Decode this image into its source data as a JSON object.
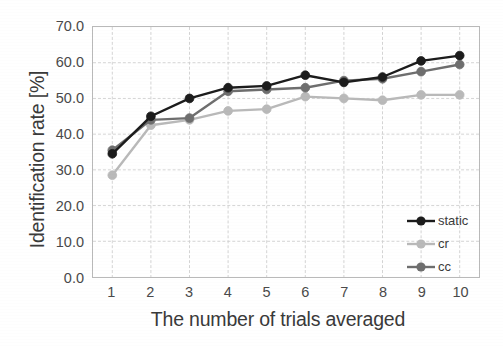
{
  "chart_data": {
    "type": "line",
    "title": "",
    "xlabel": "The number of trials averaged",
    "ylabel": "Identification rate [%]",
    "x": [
      1,
      2,
      3,
      4,
      5,
      6,
      7,
      8,
      9,
      10
    ],
    "categories": [
      "1",
      "2",
      "3",
      "4",
      "5",
      "6",
      "7",
      "8",
      "9",
      "10"
    ],
    "xlim": [
      0.5,
      10.5
    ],
    "ylim": [
      0.0,
      70.0
    ],
    "yticks": [
      "0.0",
      "10.0",
      "20.0",
      "30.0",
      "40.0",
      "50.0",
      "60.0",
      "70.0"
    ],
    "ytick_values": [
      0.0,
      10.0,
      20.0,
      30.0,
      40.0,
      50.0,
      60.0,
      70.0
    ],
    "grid": true,
    "legend_position": "bottom-right",
    "series": [
      {
        "name": "static",
        "color": "#1c1c1c",
        "marker": "circle",
        "values": [
          34.5,
          45.0,
          50.0,
          53.0,
          53.5,
          56.5,
          54.5,
          56.0,
          60.5,
          62.0
        ]
      },
      {
        "name": "cr",
        "color": "#b9b9b9",
        "marker": "circle",
        "values": [
          28.5,
          42.5,
          44.0,
          46.5,
          47.0,
          50.5,
          50.0,
          49.5,
          51.0,
          51.0
        ]
      },
      {
        "name": "cc",
        "color": "#6e6e6e",
        "marker": "circle",
        "values": [
          35.5,
          44.0,
          44.5,
          52.0,
          52.5,
          53.0,
          55.0,
          55.5,
          57.5,
          59.5
        ]
      }
    ]
  },
  "legend": {
    "items": [
      {
        "label": "static",
        "color": "#1c1c1c"
      },
      {
        "label": "cr",
        "color": "#b9b9b9"
      },
      {
        "label": "cc",
        "color": "#6e6e6e"
      }
    ]
  },
  "axis": {
    "x_title": "The number of trials averaged",
    "y_title": "Identification rate [%]"
  }
}
